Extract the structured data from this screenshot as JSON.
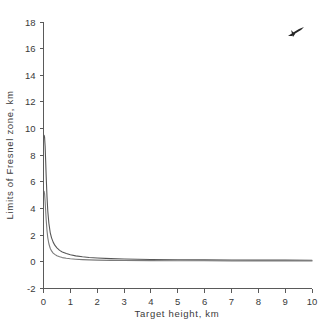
{
  "chart_data": {
    "type": "line",
    "title": "",
    "subtitle": "",
    "xlabel": "Target height, km",
    "ylabel": "Limits of Fresnel zone, km",
    "xlim": [
      0,
      10
    ],
    "ylim": [
      -2,
      18
    ],
    "xticks": [
      0,
      1,
      2,
      3,
      4,
      5,
      6,
      7,
      8,
      9,
      10
    ],
    "xtick_labels": [
      "0",
      "1",
      "2",
      "3",
      "4",
      "5",
      "6",
      "7",
      "8",
      "9",
      "10"
    ],
    "yticks": [
      -2,
      0,
      2,
      4,
      6,
      8,
      10,
      12,
      14,
      16,
      18
    ],
    "ytick_labels": [
      "-2",
      "0",
      "2",
      "4",
      "6",
      "8",
      "10",
      "12",
      "14",
      "16",
      "18"
    ],
    "grid": false,
    "legend": "none",
    "frame": "left-bottom-only",
    "series": [
      {
        "name": "upper limit",
        "color": "#575757",
        "x": [
          0.02,
          0.04,
          0.06,
          0.08,
          0.1,
          0.13,
          0.16,
          0.2,
          0.25,
          0.3,
          0.36,
          0.42,
          0.5,
          0.6,
          0.7,
          0.85,
          1.0,
          1.2,
          1.45,
          1.7,
          2.0,
          2.5,
          3.0,
          4.0,
          5.0,
          6.0,
          7.0,
          8.0,
          9.0,
          10.0
        ],
        "y": [
          9.5,
          9.35,
          8.7,
          7.6,
          6.4,
          4.9,
          3.8,
          2.9,
          2.2,
          1.8,
          1.48,
          1.25,
          1.05,
          0.86,
          0.74,
          0.62,
          0.53,
          0.45,
          0.38,
          0.33,
          0.29,
          0.24,
          0.21,
          0.18,
          0.16,
          0.15,
          0.14,
          0.13,
          0.13,
          0.12
        ]
      },
      {
        "name": "lower limit",
        "color": "#7b7b7b",
        "x": [
          0.02,
          0.04,
          0.06,
          0.08,
          0.1,
          0.13,
          0.16,
          0.2,
          0.25,
          0.3,
          0.36,
          0.42,
          0.5,
          0.6,
          0.7,
          0.85,
          1.0,
          1.2,
          1.45,
          1.7,
          2.0,
          2.5,
          3.0,
          4.0,
          5.0,
          6.0,
          7.0,
          8.0,
          9.0,
          10.0
        ],
        "y": [
          5.3,
          5.1,
          4.55,
          3.85,
          3.15,
          2.35,
          1.8,
          1.36,
          1.02,
          0.82,
          0.66,
          0.56,
          0.46,
          0.38,
          0.32,
          0.27,
          0.23,
          0.2,
          0.17,
          0.15,
          0.13,
          0.11,
          0.1,
          0.09,
          0.08,
          0.08,
          0.07,
          0.07,
          0.07,
          0.06
        ]
      }
    ],
    "annotations": [
      {
        "name": "ink-scratch-artifact",
        "text": "",
        "x_px": 296,
        "y_px": 33
      }
    ]
  }
}
